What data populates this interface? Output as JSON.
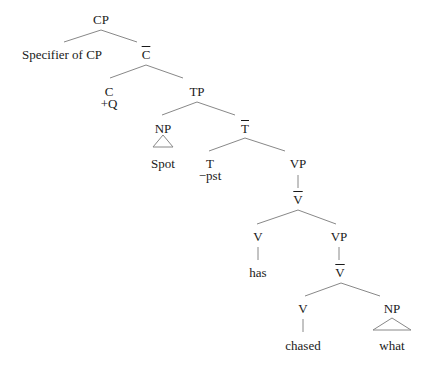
{
  "tree": {
    "nodes": [
      {
        "id": "cp",
        "label": "CP",
        "x": 101,
        "y": 13
      },
      {
        "id": "spec_cp",
        "label": "Specifier of CP",
        "x": 62,
        "y": 48
      },
      {
        "id": "cbar",
        "label": "C",
        "bar": true,
        "x": 146,
        "y": 48
      },
      {
        "id": "c",
        "label": "C",
        "x": 109,
        "y": 85
      },
      {
        "id": "c_feat",
        "label": "+Q",
        "x": 109,
        "y": 97
      },
      {
        "id": "tp",
        "label": "TP",
        "x": 197,
        "y": 85
      },
      {
        "id": "np_subj",
        "label": "NP",
        "x": 163,
        "y": 122
      },
      {
        "id": "spot",
        "label": "Spot",
        "x": 163,
        "y": 157
      },
      {
        "id": "tbar",
        "label": "T",
        "bar": true,
        "x": 245,
        "y": 122
      },
      {
        "id": "t",
        "label": "T",
        "x": 210,
        "y": 157
      },
      {
        "id": "t_feat",
        "label": "−pst",
        "x": 210,
        "y": 169
      },
      {
        "id": "vp1",
        "label": "VP",
        "x": 298,
        "y": 157
      },
      {
        "id": "vbar1",
        "label": "V",
        "bar": true,
        "x": 298,
        "y": 193
      },
      {
        "id": "v1",
        "label": "V",
        "x": 258,
        "y": 230
      },
      {
        "id": "has",
        "label": "has",
        "x": 258,
        "y": 266
      },
      {
        "id": "vp2",
        "label": "VP",
        "x": 339,
        "y": 230
      },
      {
        "id": "vbar2",
        "label": "V",
        "bar": true,
        "x": 340,
        "y": 266
      },
      {
        "id": "v2",
        "label": "V",
        "x": 303,
        "y": 302
      },
      {
        "id": "chased",
        "label": "chased",
        "x": 303,
        "y": 339
      },
      {
        "id": "np_obj",
        "label": "NP",
        "x": 392,
        "y": 302
      },
      {
        "id": "what",
        "label": "what",
        "x": 392,
        "y": 339
      }
    ],
    "edges": [
      [
        101,
        30,
        64,
        42
      ],
      [
        101,
        30,
        137,
        42
      ],
      [
        146,
        65,
        110,
        78
      ],
      [
        146,
        65,
        183,
        78
      ],
      [
        197,
        102,
        162,
        115
      ],
      [
        197,
        102,
        235,
        115
      ],
      [
        245,
        138,
        209,
        151
      ],
      [
        245,
        138,
        285,
        151
      ],
      [
        298,
        175,
        298,
        188
      ],
      [
        298,
        210,
        257,
        224
      ],
      [
        298,
        210,
        336,
        224
      ],
      [
        258,
        247,
        258,
        260
      ],
      [
        339,
        247,
        339,
        260
      ],
      [
        341,
        283,
        305,
        296
      ],
      [
        341,
        283,
        380,
        296
      ],
      [
        303,
        319,
        303,
        332
      ]
    ],
    "triangles": [
      {
        "x": 163,
        "top": 135,
        "bottom": 147,
        "half": 10
      },
      {
        "x": 392,
        "top": 318,
        "bottom": 330,
        "half": 19
      }
    ],
    "line_color": "#888888"
  }
}
